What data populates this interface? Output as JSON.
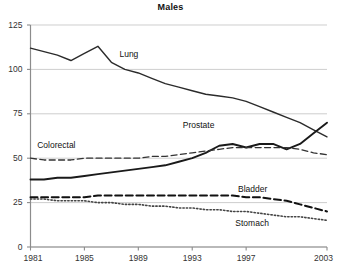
{
  "chart_data": {
    "type": "line",
    "title": "Males",
    "xlabel": "",
    "ylabel": "",
    "xlim": [
      1981,
      2003
    ],
    "ylim": [
      0,
      125
    ],
    "grid": true,
    "legend_position": "inline-labels",
    "xticks": [
      "1981",
      "1985",
      "1989",
      "1993",
      "1997",
      "2003"
    ],
    "xtick_values": [
      1981,
      1985,
      1989,
      1993,
      1997,
      2003
    ],
    "yticks": [
      "0",
      "25",
      "50",
      "75",
      "100",
      "125"
    ],
    "ytick_values": [
      0,
      25,
      50,
      75,
      100,
      125
    ],
    "x": [
      1981,
      1982,
      1983,
      1984,
      1985,
      1986,
      1987,
      1988,
      1989,
      1990,
      1991,
      1992,
      1993,
      1994,
      1995,
      1996,
      1997,
      1998,
      1999,
      2000,
      2001,
      2002,
      2003
    ],
    "series": [
      {
        "name": "Lung",
        "style": "solid",
        "color": "#2b2b2b",
        "width": 1.4,
        "label_x": 1987.6,
        "label_y": 108,
        "values": [
          112,
          110,
          108,
          105,
          109,
          113,
          104,
          100,
          98,
          95,
          92,
          90,
          88,
          86,
          85,
          84,
          82,
          79,
          76,
          73,
          70,
          66,
          62
        ]
      },
      {
        "name": "Prostate",
        "style": "solid",
        "color": "#1a1a1a",
        "width": 1.9,
        "label_x": 1992.3,
        "label_y": 68,
        "values": [
          38,
          38,
          39,
          39,
          40,
          41,
          42,
          43,
          44,
          45,
          46,
          48,
          50,
          53,
          57,
          58,
          56,
          58,
          58,
          55,
          58,
          64,
          70
        ]
      },
      {
        "name": "Colorectal",
        "style": "dashed",
        "color": "#333333",
        "width": 1.3,
        "label_x": 1981.5,
        "label_y": 57,
        "values": [
          50,
          49,
          49,
          49,
          50,
          50,
          50,
          50,
          50,
          51,
          51,
          52,
          53,
          54,
          55,
          56,
          56,
          56,
          56,
          56,
          55,
          53,
          52
        ]
      },
      {
        "name": "Bladder",
        "style": "dashed-thick",
        "color": "#111111",
        "width": 2.0,
        "label_x": 1996.4,
        "label_y": 32,
        "values": [
          28,
          28,
          28,
          28,
          28,
          29,
          29,
          29,
          29,
          29,
          29,
          29,
          29,
          29,
          29,
          29,
          28,
          28,
          27,
          26,
          24,
          22,
          20
        ]
      },
      {
        "name": "Stomach",
        "style": "dotted",
        "color": "#444444",
        "width": 1.6,
        "label_x": 1996.2,
        "label_y": 13,
        "values": [
          27,
          27,
          26,
          26,
          26,
          25,
          25,
          24,
          24,
          23,
          23,
          22,
          22,
          21,
          21,
          20,
          20,
          19,
          18,
          17,
          17,
          16,
          15
        ]
      }
    ]
  }
}
